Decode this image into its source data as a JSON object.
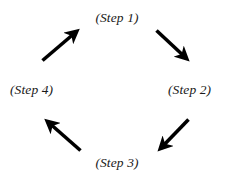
{
  "diagram": {
    "type": "cycle",
    "direction": "clockwise",
    "background_color": "#ffffff",
    "arrow_color": "#000000",
    "text_color": "#1a1a1a",
    "steps": [
      {
        "id": "step-1",
        "label": "(Step 1)",
        "position": "top"
      },
      {
        "id": "step-2",
        "label": "(Step 2)",
        "position": "right"
      },
      {
        "id": "step-3",
        "label": "(Step 3)",
        "position": "bottom"
      },
      {
        "id": "step-4",
        "label": "(Step 4)",
        "position": "left"
      }
    ],
    "arrows": [
      {
        "id": "arrow-step-1-to-step-2",
        "from": "(Step 1)",
        "to": "(Step 2)",
        "direction": "down-right"
      },
      {
        "id": "arrow-step-2-to-step-3",
        "from": "(Step 2)",
        "to": "(Step 3)",
        "direction": "down-left"
      },
      {
        "id": "arrow-step-3-to-step-4",
        "from": "(Step 3)",
        "to": "(Step 4)",
        "direction": "up-left"
      },
      {
        "id": "arrow-step-4-to-step-1",
        "from": "(Step 4)",
        "to": "(Step 1)",
        "direction": "up-right"
      }
    ]
  }
}
